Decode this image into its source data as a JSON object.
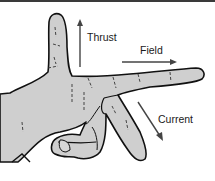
{
  "diagram": {
    "labels": {
      "thrust": "Thrust",
      "field": "Field",
      "current": "Current"
    },
    "colors": {
      "skin": "#cfcfcf",
      "outline": "#111111",
      "arrow": "#444444",
      "background": "#ffffff"
    }
  }
}
